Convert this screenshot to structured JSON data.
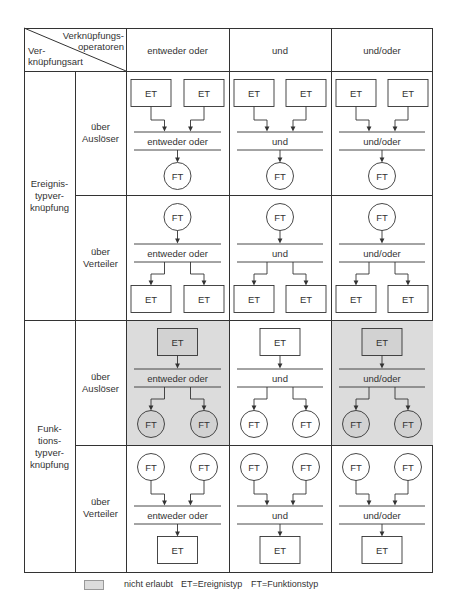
{
  "header": {
    "corner_top": "Verknüpfungs-",
    "corner_top2": "operatoren",
    "corner_bottom": "Ver-",
    "corner_bottom2": "knüpfungsart",
    "columns": [
      "entweder oder",
      "und",
      "und/oder"
    ]
  },
  "groups": [
    {
      "label_lines": [
        "Ereignis-",
        "typver-",
        "knüpfung"
      ]
    },
    {
      "label_lines": [
        "Funk-",
        "tions-",
        "typver-",
        "knüpfung"
      ]
    }
  ],
  "subrows": [
    {
      "label_lines": [
        "über",
        "Auslöser"
      ]
    },
    {
      "label_lines": [
        "über",
        "Verteiler"
      ]
    },
    {
      "label_lines": [
        "über",
        "Auslöser"
      ]
    },
    {
      "label_lines": [
        "über",
        "Verteiler"
      ]
    }
  ],
  "cells": [
    [
      {
        "pattern": "merge",
        "top": "ET",
        "bottom": "FT",
        "operator": "entweder oder",
        "shaded": false
      },
      {
        "pattern": "merge",
        "top": "ET",
        "bottom": "FT",
        "operator": "und",
        "shaded": false
      },
      {
        "pattern": "merge",
        "top": "ET",
        "bottom": "FT",
        "operator": "und/oder",
        "shaded": false
      }
    ],
    [
      {
        "pattern": "split",
        "top": "FT",
        "bottom": "ET",
        "operator": "entweder oder",
        "shaded": false
      },
      {
        "pattern": "split",
        "top": "FT",
        "bottom": "ET",
        "operator": "und",
        "shaded": false
      },
      {
        "pattern": "split",
        "top": "FT",
        "bottom": "ET",
        "operator": "und/oder",
        "shaded": false
      }
    ],
    [
      {
        "pattern": "split",
        "top": "ET",
        "bottom": "FT",
        "operator": "entweder oder",
        "shaded": true
      },
      {
        "pattern": "split",
        "top": "ET",
        "bottom": "FT",
        "operator": "und",
        "shaded": false
      },
      {
        "pattern": "split",
        "top": "ET",
        "bottom": "FT",
        "operator": "und/oder",
        "shaded": true
      }
    ],
    [
      {
        "pattern": "merge",
        "top": "FT",
        "bottom": "ET",
        "operator": "entweder oder",
        "shaded": false
      },
      {
        "pattern": "merge",
        "top": "FT",
        "bottom": "ET",
        "operator": "und",
        "shaded": false
      },
      {
        "pattern": "merge",
        "top": "FT",
        "bottom": "ET",
        "operator": "und/oder",
        "shaded": false
      }
    ]
  ],
  "legend": {
    "swatch_label": "nicht erlaubt",
    "et": "ET=Ereignistyp",
    "ft": "FT=Funktionstyp"
  },
  "colors": {
    "line": "#333333",
    "shade": "#dcdcdc",
    "shade_node": "#d2d2d2"
  }
}
